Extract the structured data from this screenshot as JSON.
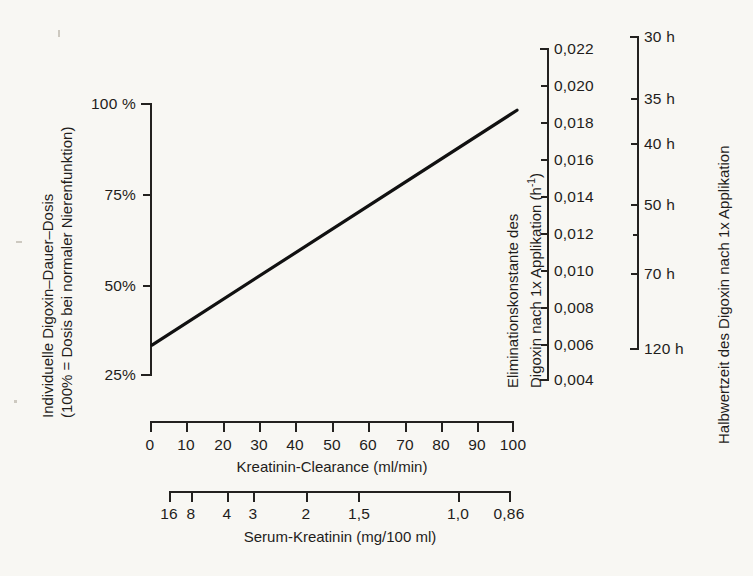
{
  "chart_data": {
    "type": "line",
    "title": "",
    "xlabel": "Kreatinin-Clearance (ml/min)",
    "ylabel": "Individuelle Digoxin-Dauer-Dosis (100% = Dosis bei normaler Nierenfunktion)",
    "x": [
      0,
      100
    ],
    "values": [
      33,
      98
    ],
    "xlim": [
      0,
      100
    ],
    "ylim": [
      25,
      100
    ],
    "grid": false,
    "legend": "none",
    "series": [
      {
        "name": "Digoxin-Dauer-Dosis vs. Kreatinin-Clearance",
        "x": [
          0,
          10,
          20,
          30,
          40,
          50,
          60,
          70,
          80,
          90,
          100
        ],
        "values": [
          33,
          39.5,
          46,
          52.5,
          59,
          65.5,
          72,
          78.5,
          85,
          91.5,
          98
        ]
      }
    ],
    "axes": [
      {
        "name": "y-left-dose",
        "label_line1": "Individuelle Digoxin–Dauer–Dosis",
        "label_line2": "(100% = Dosis bei normaler Nierenfunktion)",
        "ticks": [
          "100 %",
          "75%",
          "50%",
          "25%"
        ],
        "tick_values": [
          100,
          75,
          50,
          25
        ]
      },
      {
        "name": "x-bottom-clearance",
        "label": "Kreatinin-Clearance (ml/min)",
        "ticks": [
          "0",
          "10",
          "20",
          "30",
          "40",
          "50",
          "60",
          "70",
          "80",
          "90",
          "100"
        ],
        "tick_values": [
          0,
          10,
          20,
          30,
          40,
          50,
          60,
          70,
          80,
          90,
          100
        ]
      },
      {
        "name": "x-bottom-serum-creatinine",
        "label": "Serum-Kreatinin (mg/100 ml)",
        "ticks": [
          "16",
          "8",
          "4",
          "3",
          "2",
          "1,5",
          "1,0",
          "0,86"
        ],
        "tick_values": [
          16,
          8,
          4,
          3,
          2,
          1.5,
          1.0,
          0.86
        ]
      },
      {
        "name": "y-right-elimination-constant",
        "label_line1": "Eliminationskonstante des",
        "label_line2": "Digoxin nach 1x Applikation (h",
        "label_exponent": "-1",
        "label_close": ")",
        "ticks": [
          "0,022",
          "0,020",
          "0,018",
          "0,016",
          "0,014",
          "0,012",
          "0,010",
          "0,008",
          "0,006",
          "0,004"
        ],
        "tick_values": [
          0.022,
          0.02,
          0.018,
          0.016,
          0.014,
          0.012,
          0.01,
          0.008,
          0.006,
          0.004
        ]
      },
      {
        "name": "y-right-half-life",
        "label": "Halbwertzeit des Digoxin nach 1x Applikation",
        "ticks": [
          "30 h",
          "35 h",
          "40 h",
          "50 h",
          "70 h",
          "120 h"
        ],
        "tick_values": [
          30,
          35,
          40,
          50,
          70,
          120
        ]
      }
    ],
    "colors": {
      "background": "#f8f7f3",
      "ink": "#23211f",
      "line": "#111111"
    }
  },
  "y_left": {
    "title_line1": "Individuelle Digoxin–Dauer–Dosis",
    "title_line2": "(100% = Dosis bei normaler Nierenfunktion)",
    "t0": "100 %",
    "t1": "75%",
    "t2": "50%",
    "t3": "25%"
  },
  "x_clearance": {
    "title": "Kreatinin-Clearance (ml/min)",
    "t0": "0",
    "t1": "10",
    "t2": "20",
    "t3": "30",
    "t4": "40",
    "t5": "50",
    "t6": "60",
    "t7": "70",
    "t8": "80",
    "t9": "90",
    "t10": "100"
  },
  "x_serum": {
    "title": "Serum-Kreatinin (mg/100 ml)",
    "t0": "16",
    "t1": "8",
    "t2": "4",
    "t3": "3",
    "t4": "2",
    "t5": "1,5",
    "t6": "1,0",
    "t7": "0,86"
  },
  "y_elim": {
    "title_line1": "Eliminationskonstante des",
    "title_line2_pre": "Digoxin nach 1x Applikation (h",
    "title_line2_sup": "-1",
    "title_line2_post": ")",
    "t0": "0,022",
    "t1": "0,020",
    "t2": "0,018",
    "t3": "0,016",
    "t4": "0,014",
    "t5": "0,012",
    "t6": "0,010",
    "t7": "0,008",
    "t8": "0,006",
    "t9": "0,004"
  },
  "y_half": {
    "title": "Halbwertzeit des Digoxin nach 1x Applikation",
    "t0": "30 h",
    "t1": "35 h",
    "t2": "40 h",
    "t3": "50 h",
    "t4": "70 h",
    "t5": "120 h"
  }
}
